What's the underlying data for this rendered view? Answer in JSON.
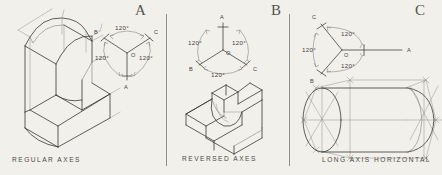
{
  "figure": {
    "background_color": "#f2f0eb",
    "ink_color": "#3a3835"
  },
  "panels": [
    {
      "letter": "A",
      "caption": "REGULAR AXES",
      "axes": {
        "origin_label": "O",
        "labels": {
          "a": "A",
          "b": "B",
          "c": "C"
        },
        "angles": [
          "120°",
          "120°",
          "120°"
        ],
        "a_direction": "down",
        "b_direction": "upper-left",
        "c_direction": "upper-right"
      },
      "object": "l-shaped-bracket-rounded-top"
    },
    {
      "letter": "B",
      "caption": "REVERSED AXES",
      "axes": {
        "origin_label": "O",
        "labels": {
          "a": "A",
          "b": "B",
          "c": "C"
        },
        "angles": [
          "120°",
          "120°",
          "120°"
        ],
        "a_direction": "up",
        "b_direction": "lower-left",
        "c_direction": "lower-right"
      },
      "object": "l-shaped-bracket-viewed-from-below"
    },
    {
      "letter": "C",
      "caption": "LONG AXIS HORIZONTAL",
      "axes": {
        "origin_label": "O",
        "labels": {
          "a": "A",
          "b": "B",
          "c": "C"
        },
        "angles": [
          "120°",
          "120°",
          "120°"
        ],
        "a_direction": "right-horizontal",
        "b_direction": "lower-left",
        "c_direction": "upper-left"
      },
      "object": "horizontal-cylinder-with-construction-lines"
    }
  ]
}
